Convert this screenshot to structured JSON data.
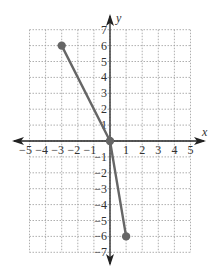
{
  "chart_data": {
    "type": "line",
    "title": "",
    "xlabel": "x",
    "ylabel": "y",
    "xlim": [
      -5,
      5
    ],
    "ylim": [
      -7,
      7
    ],
    "grid": true,
    "x_ticks": [
      -5,
      -4,
      -3,
      -2,
      -1,
      1,
      2,
      3,
      4,
      5
    ],
    "y_ticks": [
      -7,
      -6,
      -5,
      -4,
      -3,
      -2,
      -1,
      1,
      2,
      3,
      4,
      5,
      6,
      7
    ],
    "series": [
      {
        "name": "piecewise segment",
        "points": [
          [
            -3,
            6
          ],
          [
            0,
            0
          ],
          [
            1,
            -6
          ]
        ],
        "color": "#666666",
        "endpoints": "closed"
      }
    ]
  },
  "style": {
    "grid_color": "#9a9a9a",
    "axis_color": "#222222",
    "line_color": "#666666"
  }
}
